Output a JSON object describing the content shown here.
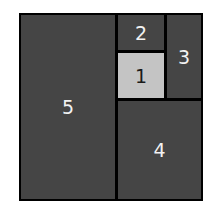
{
  "diagram": {
    "type": "nested-rectangles",
    "colors": {
      "border": "#000000",
      "dark_fill": "#454545",
      "light_fill": "#c4c4c4",
      "dark_label": "#f2f2f2",
      "light_label": "#1a1a1a"
    },
    "regions": [
      {
        "id": 1,
        "label": "1",
        "highlighted": true
      },
      {
        "id": 2,
        "label": "2",
        "highlighted": false
      },
      {
        "id": 3,
        "label": "3",
        "highlighted": false
      },
      {
        "id": 4,
        "label": "4",
        "highlighted": false
      },
      {
        "id": 5,
        "label": "5",
        "highlighted": false
      }
    ]
  }
}
